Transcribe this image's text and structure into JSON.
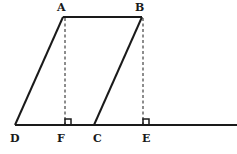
{
  "diagram": {
    "type": "geometry-parallelograms",
    "points": {
      "A": {
        "label": "A",
        "x": 63,
        "y": 17
      },
      "B": {
        "label": "B",
        "x": 142,
        "y": 17
      },
      "D": {
        "label": "D",
        "x": 15,
        "y": 125
      },
      "F": {
        "label": "F",
        "x": 67,
        "y": 125
      },
      "C": {
        "label": "C",
        "x": 94,
        "y": 125
      },
      "E": {
        "label": "E",
        "x": 145,
        "y": 125
      }
    },
    "labels": {
      "A": "A",
      "B": "B",
      "D": "D",
      "F": "F",
      "C": "C",
      "E": "E"
    },
    "segments": [
      {
        "from": "A",
        "to": "B",
        "style": "solid"
      },
      {
        "from": "A",
        "to": "D",
        "style": "solid"
      },
      {
        "from": "B",
        "to": "C",
        "style": "solid"
      },
      {
        "from": "D",
        "to": "line-end",
        "style": "solid"
      },
      {
        "from": "A",
        "to": "F",
        "style": "dashed"
      },
      {
        "from": "B",
        "to": "E",
        "style": "dashed"
      }
    ],
    "right_angle_markers": [
      "F",
      "E"
    ],
    "colors": {
      "stroke": "#1a1a1a",
      "background": "#ffffff"
    }
  }
}
